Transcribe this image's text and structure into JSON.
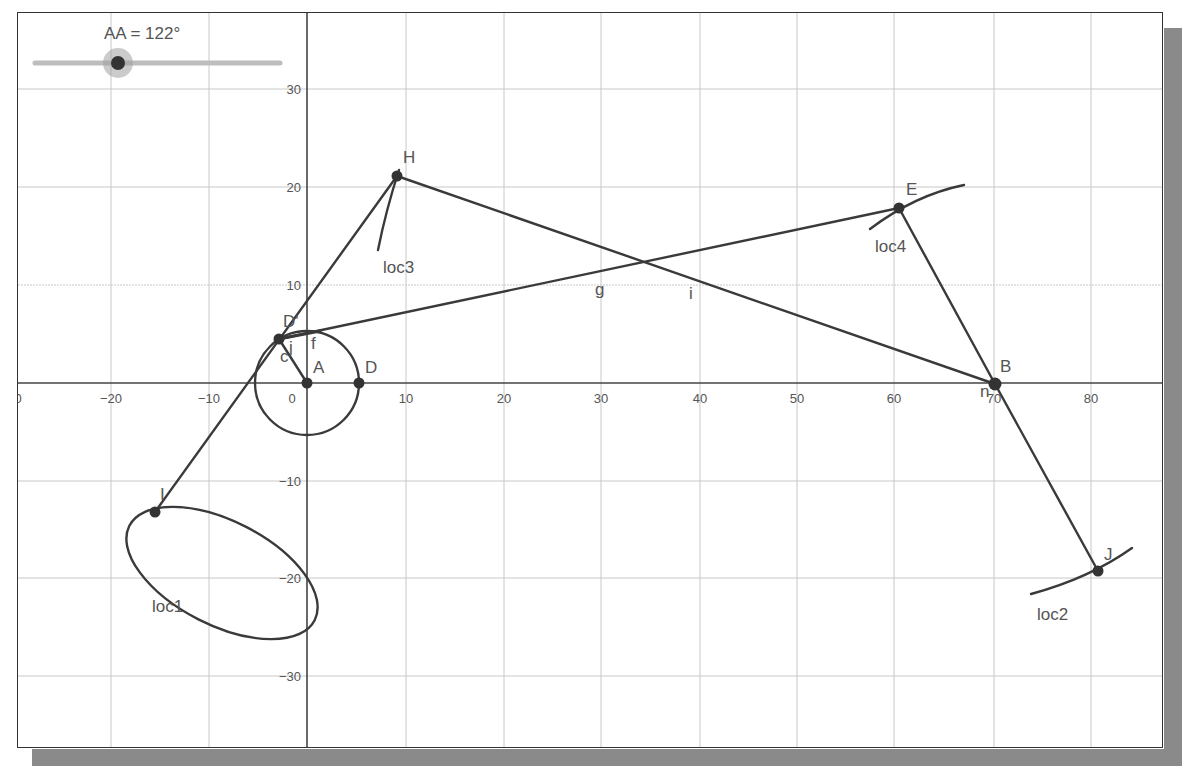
{
  "slider": {
    "label": "AA = 122°",
    "name": "AA",
    "value_deg": 122
  },
  "axes": {
    "x_ticks": [
      {
        "label": "0",
        "v": -30
      },
      {
        "label": "−20",
        "v": -20
      },
      {
        "label": "−10",
        "v": -10
      },
      {
        "label": "0",
        "v": 0
      },
      {
        "label": "10",
        "v": 10
      },
      {
        "label": "20",
        "v": 20
      },
      {
        "label": "30",
        "v": 30
      },
      {
        "label": "40",
        "v": 40
      },
      {
        "label": "50",
        "v": 50
      },
      {
        "label": "60",
        "v": 60
      },
      {
        "label": "70",
        "v": 70
      },
      {
        "label": "80",
        "v": 80
      }
    ],
    "y_ticks": [
      {
        "label": "30",
        "v": 30
      },
      {
        "label": "20",
        "v": 20
      },
      {
        "label": "10",
        "v": 10
      },
      {
        "label": "−10",
        "v": -10
      },
      {
        "label": "−20",
        "v": -20
      },
      {
        "label": "−30",
        "v": -30
      }
    ]
  },
  "points": {
    "A": "A",
    "D": "D",
    "Dp": "D'",
    "H": "H",
    "E": "E",
    "B": "B",
    "J": "J",
    "I": "I"
  },
  "segments": {
    "c": "c",
    "j": "j",
    "f": "f",
    "g": "g",
    "i": "i",
    "n": "n"
  },
  "loci": {
    "loc1": "loc1",
    "loc2": "loc2",
    "loc3": "loc3",
    "loc4": "loc4"
  },
  "colors": {
    "line": "#3a3a3a",
    "grid": "#c8c8c8",
    "axis": "#444444",
    "label": "#555555",
    "slider_track": "#bdbdbd",
    "slider_knob": "#333333",
    "shadow": "#8a8a8a"
  }
}
